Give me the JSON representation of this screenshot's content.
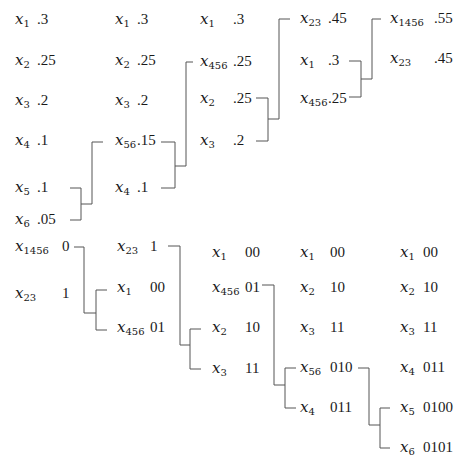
{
  "merge_phase": {
    "stages": [
      {
        "items": [
          {
            "sym": "x",
            "sub": "1",
            "val": ".3"
          },
          {
            "sym": "x",
            "sub": "2",
            "val": ".25"
          },
          {
            "sym": "x",
            "sub": "3",
            "val": ".2"
          },
          {
            "sym": "x",
            "sub": "4",
            "val": ".1"
          },
          {
            "sym": "x",
            "sub": "5",
            "val": ".1"
          },
          {
            "sym": "x",
            "sub": "6",
            "val": ".05"
          }
        ]
      },
      {
        "items": [
          {
            "sym": "x",
            "sub": "1",
            "val": ".3"
          },
          {
            "sym": "x",
            "sub": "2",
            "val": ".25"
          },
          {
            "sym": "x",
            "sub": "3",
            "val": ".2"
          },
          {
            "sym": "x",
            "sub": "56",
            "val": ".15"
          },
          {
            "sym": "x",
            "sub": "4",
            "val": ".1"
          }
        ]
      },
      {
        "items": [
          {
            "sym": "x",
            "sub": "1",
            "val": ".3"
          },
          {
            "sym": "x",
            "sub": "456",
            "val": ".25"
          },
          {
            "sym": "x",
            "sub": "2",
            "val": ".25"
          },
          {
            "sym": "x",
            "sub": "3",
            "val": ".2"
          }
        ]
      },
      {
        "items": [
          {
            "sym": "x",
            "sub": "23",
            "val": ".45"
          },
          {
            "sym": "x",
            "sub": "1",
            "val": ".3"
          },
          {
            "sym": "x",
            "sub": "456",
            "val": ".25"
          }
        ]
      },
      {
        "items": [
          {
            "sym": "x",
            "sub": "1456",
            "val": ".55"
          },
          {
            "sym": "x",
            "sub": "23",
            "val": ".45"
          }
        ]
      }
    ]
  },
  "code_phase": {
    "stages": [
      {
        "items": [
          {
            "sym": "x",
            "sub": "1456",
            "val": "0"
          },
          {
            "sym": "x",
            "sub": "23",
            "val": "1"
          }
        ]
      },
      {
        "items": [
          {
            "sym": "x",
            "sub": "23",
            "val": "1"
          },
          {
            "sym": "x",
            "sub": "1",
            "val": "00"
          },
          {
            "sym": "x",
            "sub": "456",
            "val": "01"
          }
        ]
      },
      {
        "items": [
          {
            "sym": "x",
            "sub": "1",
            "val": "00"
          },
          {
            "sym": "x",
            "sub": "456",
            "val": "01"
          },
          {
            "sym": "x",
            "sub": "2",
            "val": "10"
          },
          {
            "sym": "x",
            "sub": "3",
            "val": "11"
          }
        ]
      },
      {
        "items": [
          {
            "sym": "x",
            "sub": "1",
            "val": "00"
          },
          {
            "sym": "x",
            "sub": "2",
            "val": "10"
          },
          {
            "sym": "x",
            "sub": "3",
            "val": "11"
          },
          {
            "sym": "x",
            "sub": "56",
            "val": "010"
          },
          {
            "sym": "x",
            "sub": "4",
            "val": "011"
          }
        ]
      },
      {
        "items": [
          {
            "sym": "x",
            "sub": "1",
            "val": "00"
          },
          {
            "sym": "x",
            "sub": "2",
            "val": "10"
          },
          {
            "sym": "x",
            "sub": "3",
            "val": "11"
          },
          {
            "sym": "x",
            "sub": "4",
            "val": "011"
          },
          {
            "sym": "x",
            "sub": "5",
            "val": "0100"
          },
          {
            "sym": "x",
            "sub": "6",
            "val": "0101"
          }
        ]
      }
    ]
  },
  "colors": {
    "text": "#1a1a1a",
    "line": "#555555",
    "background": "#ffffff"
  }
}
